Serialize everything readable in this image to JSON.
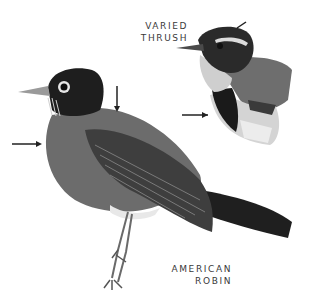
{
  "illustration": {
    "birds": [
      {
        "name": "varied-thrush",
        "label_line1": "VARIED",
        "label_line2": "THRUSH"
      },
      {
        "name": "american-robin",
        "label_line1": "AMERICAN",
        "label_line2": "ROBIN"
      }
    ],
    "colors": {
      "background": "#ffffff",
      "robin_head": "#1e1e1e",
      "robin_breast": "#6a6a6a",
      "robin_wing": "#3c3c3c",
      "thrush_band": "#1a1a1a",
      "thrush_throat": "#c8c8c8"
    }
  }
}
